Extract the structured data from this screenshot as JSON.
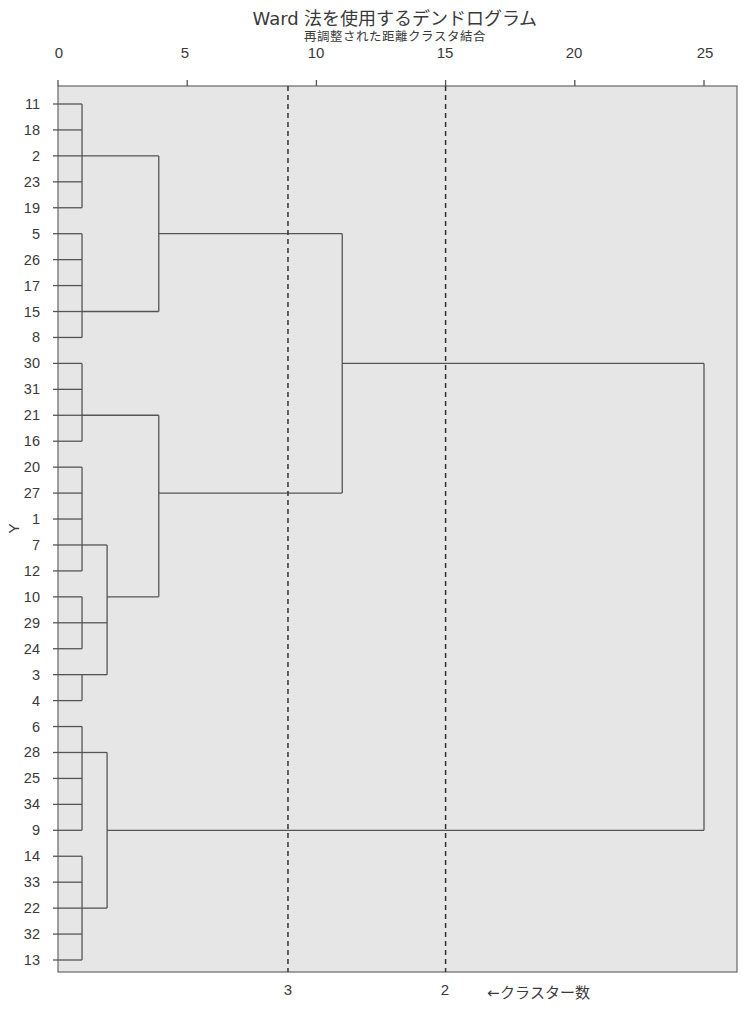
{
  "chart_data": {
    "type": "dendrogram",
    "title": "Ward 法を使用するデンドログラム",
    "subtitle": "再調整された距離クラスタ結合",
    "xlabel": "再調整された距離クラスタ結合",
    "ylabel": "Y",
    "xlim": [
      0,
      26.3
    ],
    "x_ticks": [
      0,
      5,
      10,
      15,
      20,
      25
    ],
    "leaf_order": [
      "11",
      "18",
      "2",
      "23",
      "19",
      "5",
      "26",
      "17",
      "15",
      "8",
      "30",
      "31",
      "21",
      "16",
      "20",
      "27",
      "1",
      "7",
      "12",
      "10",
      "29",
      "24",
      "3",
      "4",
      "6",
      "28",
      "25",
      "34",
      "9",
      "14",
      "33",
      "22",
      "32",
      "13"
    ],
    "merges": [
      {
        "members": [
          "11",
          "18",
          "2",
          "23",
          "19"
        ],
        "height": 0.93,
        "anchor_leaf": "2"
      },
      {
        "members": [
          "5",
          "26",
          "17",
          "15",
          "8"
        ],
        "height": 0.93,
        "anchor_leaf": "15"
      },
      {
        "members": [
          "30",
          "31",
          "21",
          "16"
        ],
        "height": 0.93,
        "anchor_leaf": "21"
      },
      {
        "members": [
          "20",
          "27",
          "1",
          "7",
          "12"
        ],
        "height": 0.93,
        "anchor_leaf": "7"
      },
      {
        "members": [
          "10",
          "29",
          "24"
        ],
        "height": 0.93,
        "anchor_leaf": "29"
      },
      {
        "members": [
          "3",
          "4"
        ],
        "height": 0.93,
        "anchor_leaf": "3"
      },
      {
        "members": [
          "6",
          "28",
          "25",
          "34",
          "9"
        ],
        "height": 0.93,
        "anchor_leaf": "28"
      },
      {
        "members": [
          "14",
          "33",
          "22",
          "32",
          "13"
        ],
        "height": 0.93,
        "anchor_leaf": "22"
      },
      {
        "members": [
          "C(20..12)",
          "C(10,29,24)",
          "C(3,4)"
        ],
        "height": 1.9,
        "anchor_leaf": "10"
      },
      {
        "members": [
          "C(6..9)",
          "C(14..13)"
        ],
        "height": 1.9,
        "anchor_leaf": "9"
      },
      {
        "members": [
          "C(11..19)",
          "C(5..8)"
        ],
        "height": 3.9,
        "anchor_leaf": "5"
      },
      {
        "members": [
          "C(30..16)",
          "C(20..4)"
        ],
        "height": 3.9,
        "anchor_leaf": "27"
      },
      {
        "members": [
          "C(11..8)",
          "C(30..4)"
        ],
        "height": 11.0,
        "anchor_leaf": "30"
      },
      {
        "members": [
          "C(11..4)",
          "C(6..13)"
        ],
        "height": 25.0,
        "anchor_leaf": "none"
      }
    ],
    "cut_lines": [
      {
        "distance": 8.9,
        "clusters": 3,
        "style": "dashed"
      },
      {
        "distance": 15.0,
        "clusters": 2,
        "style": "dashed"
      }
    ],
    "annotation": "←クラスター数"
  },
  "labels": {
    "title": "Ward 法を使用するデンドログラム",
    "subtitle": "再調整された距離クラスタ結合",
    "ylabel": "Y",
    "ticks": [
      "0",
      "5",
      "10",
      "15",
      "20",
      "25"
    ],
    "cut_3": "3",
    "cut_2": "2",
    "caption": "←クラスター数",
    "rows": [
      "11",
      "18",
      "2",
      "23",
      "19",
      "5",
      "26",
      "17",
      "15",
      "8",
      "30",
      "31",
      "21",
      "16",
      "20",
      "27",
      "1",
      "7",
      "12",
      "10",
      "29",
      "24",
      "3",
      "4",
      "6",
      "28",
      "25",
      "34",
      "9",
      "14",
      "33",
      "22",
      "32",
      "13"
    ]
  },
  "colors": {
    "plot_bg": "#e6e6e6",
    "line": "#555555",
    "text": "#3a3a3a"
  }
}
